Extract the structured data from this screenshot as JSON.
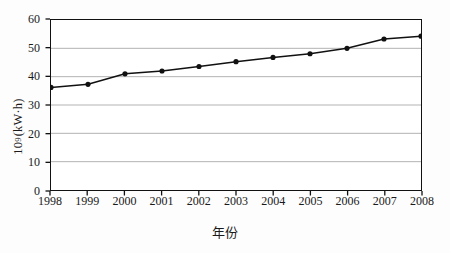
{
  "chart_data": {
    "type": "line",
    "title": "",
    "subtitle": "",
    "xlabel": "年份",
    "ylabel_base": "10",
    "ylabel_exponent": "9",
    "ylabel_unit": "(kW·h)",
    "ylabel_full": "10⁹ (kW·h)",
    "categories": [
      "1998",
      "1999",
      "2000",
      "2001",
      "2002",
      "2003",
      "2004",
      "2005",
      "2006",
      "2007",
      "2008"
    ],
    "values": [
      36.2,
      37.3,
      41.0,
      42.0,
      43.6,
      45.3,
      46.8,
      48.1,
      50.0,
      53.3,
      54.3
    ],
    "ylim": [
      0,
      60
    ],
    "y_ticks": [
      "0",
      "10",
      "20",
      "30",
      "40",
      "50",
      "60"
    ],
    "y_tick_values": [
      0,
      10,
      20,
      30,
      40,
      50,
      60
    ],
    "grid": true,
    "grid_axis": "y",
    "legend": false,
    "legend_position": "none",
    "marker": "circle",
    "colors": {
      "line": "#111111",
      "marker": "#111111",
      "grid": "#aaaaaa",
      "frame": "#111111",
      "background": "#ffffff"
    }
  }
}
